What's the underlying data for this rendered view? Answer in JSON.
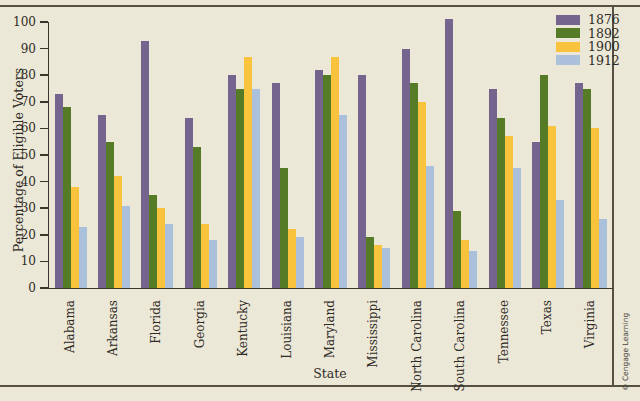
{
  "figure": {
    "copyright": "© Cengage Learning"
  },
  "chart_data": {
    "type": "bar",
    "title": "",
    "xlabel": "State",
    "ylabel": "Percentage of Eligible Voters",
    "ylim": [
      0,
      100
    ],
    "yticks": [
      0,
      10,
      20,
      30,
      40,
      50,
      60,
      70,
      80,
      90,
      100
    ],
    "grid": false,
    "legend_position": "top-right",
    "categories": [
      "Alabama",
      "Arkansas",
      "Florida",
      "Georgia",
      "Kentucky",
      "Louisiana",
      "Maryland",
      "Mississippi",
      "North Carolina",
      "South Carolina",
      "Tennessee",
      "Texas",
      "Virginia"
    ],
    "series": [
      {
        "name": "1876",
        "color": "#75648D",
        "values": [
          73,
          65,
          93,
          64,
          80,
          77,
          82,
          80,
          90,
          101,
          75,
          55,
          77
        ]
      },
      {
        "name": "1892",
        "color": "#567B26",
        "values": [
          68,
          55,
          35,
          53,
          75,
          45,
          80,
          19,
          77,
          29,
          64,
          80,
          75
        ]
      },
      {
        "name": "1900",
        "color": "#FAC33E",
        "values": [
          38,
          42,
          30,
          24,
          87,
          22,
          87,
          16,
          70,
          18,
          57,
          61,
          60
        ]
      },
      {
        "name": "1912",
        "color": "#ABC0DA",
        "values": [
          23,
          31,
          24,
          18,
          75,
          19,
          65,
          15,
          46,
          14,
          45,
          33,
          26
        ]
      }
    ],
    "colors": {
      "background": "#ECE8D7",
      "axis": "#3B362C",
      "rule": "#564F42",
      "text": "#2F2B26"
    }
  }
}
